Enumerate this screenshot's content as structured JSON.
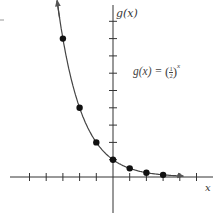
{
  "chart_data": {
    "type": "line",
    "title": "",
    "function_label": "g(x) = (1/2)^x",
    "xlabel": "x",
    "ylabel": "g(x)",
    "x_ticks": [
      -5,
      -4,
      -3,
      -2,
      -1,
      0,
      1,
      2,
      3,
      4,
      5
    ],
    "y_ticks": [
      1,
      2,
      3,
      4,
      5,
      6,
      7,
      8,
      9
    ],
    "xlim": [
      -6,
      6
    ],
    "ylim": [
      -2,
      10
    ],
    "grid": false,
    "series": [
      {
        "name": "g(x) = (1/2)^x",
        "points": [
          {
            "x": -3,
            "y": 8
          },
          {
            "x": -2,
            "y": 4
          },
          {
            "x": -1,
            "y": 2
          },
          {
            "x": 0,
            "y": 1
          },
          {
            "x": 1,
            "y": 0.5
          },
          {
            "x": 2,
            "y": 0.25
          },
          {
            "x": 3,
            "y": 0.125
          }
        ]
      }
    ]
  },
  "labels": {
    "y_axis": "g(x)",
    "x_axis": "x",
    "formula_prefix": "g(x) = ",
    "formula_num": "1",
    "formula_den": "2",
    "formula_exp": "x"
  },
  "colors": {
    "axis": "#333333",
    "curve": "#444444",
    "point": "#111111"
  }
}
